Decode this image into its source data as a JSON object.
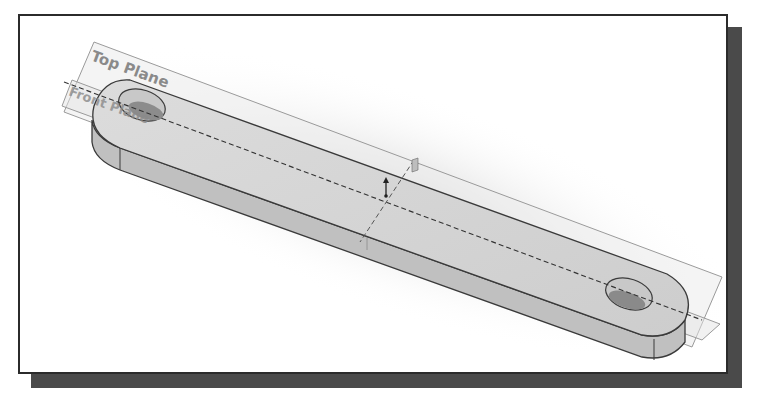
{
  "figure": {
    "labels": {
      "top_plane": "Top Plane",
      "front_plane": "Front Plane"
    },
    "colors": {
      "frame_border": "#2b2b2b",
      "shadow": "#4a4a4a",
      "part_top_face": "#d6d6d6",
      "part_side_face": "#bdbdbd",
      "plane_fill": "#e9e9e9",
      "edge": "#3a3a3a"
    }
  }
}
